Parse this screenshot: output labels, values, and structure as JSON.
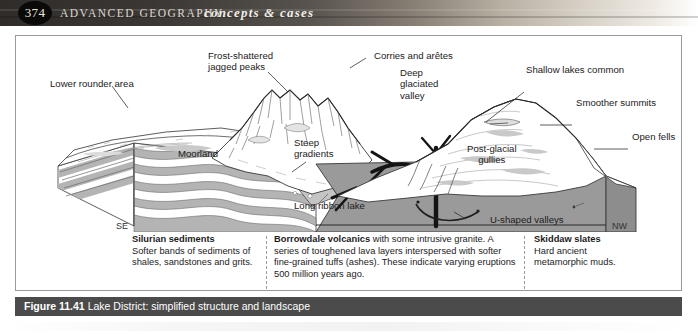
{
  "header": {
    "page_number": "374",
    "book_title": "ADVANCED GEOGRAPHY",
    "series_title": "concepts & cases"
  },
  "figure": {
    "number": "Figure 11.41",
    "caption": "Lake District: simplified structure and landscape"
  },
  "diagram": {
    "labels": [
      {
        "id": "lower-rounder-area",
        "text": "Lower rounder area"
      },
      {
        "id": "frost-shattered-jagged-peaks",
        "text": "Frost-shattered\njagged peaks"
      },
      {
        "id": "corries-and-aretes",
        "text": "Corries and arêtes"
      },
      {
        "id": "deep-glaciated-valley",
        "text": "Deep\nglaciated\nvalley"
      },
      {
        "id": "shallow-lakes-common",
        "text": "Shallow lakes common"
      },
      {
        "id": "smoother-summits",
        "text": "Smoother summits"
      },
      {
        "id": "open-fells",
        "text": "Open fells"
      },
      {
        "id": "moorland",
        "text": "Moorland"
      },
      {
        "id": "steep-gradients",
        "text": "Steep\ngradients"
      },
      {
        "id": "long-ribbon-lake",
        "text": "Long ribbon lake"
      },
      {
        "id": "post-glacial-gullies",
        "text": "Post-glacial\ngullies"
      },
      {
        "id": "u-shaped-valleys",
        "text": "U-shaped valleys"
      }
    ],
    "compass": {
      "southeast": "SE",
      "northwest": "NW"
    }
  },
  "geology_columns": [
    {
      "id": "silurian-sediments",
      "title": "Silurian sediments",
      "body": "Softer bands of sediments of shales, sandstones and grits."
    },
    {
      "id": "borrowdale-volcanics",
      "title": "Borrowdale volcanics",
      "body": " with some intrusive granite. A series of toughened lava layers interspersed with softer fine-grained tuffs (ashes). These indicate varying eruptions 500 million years ago."
    },
    {
      "id": "skiddaw-slates",
      "title": "Skiddaw slates",
      "body": "Hard ancient metamorphic muds."
    }
  ],
  "colors": {
    "header_band_dark": "#2f2c2a",
    "caption_bar": "#4b4b4b",
    "volcanic_block": "#9a9a9a",
    "sediment_band": "#b4b4b4",
    "frame_border": "#9a9a9a"
  }
}
